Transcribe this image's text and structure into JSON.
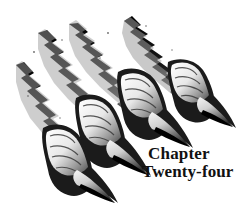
{
  "canvas": {
    "width": 247,
    "height": 212,
    "background_color": "#ffffff"
  },
  "artwork": {
    "name": "monster-claw-slash-marks",
    "description": "Four diagonal torn slash marks with clawed talons breaking through",
    "ink_color": "#000000",
    "shade_color": "#8a8a8a",
    "slash_count": 4,
    "claw_count": 4
  },
  "caption": {
    "line1": "Chapter",
    "line2": "Twenty-four",
    "color": "#111111"
  }
}
